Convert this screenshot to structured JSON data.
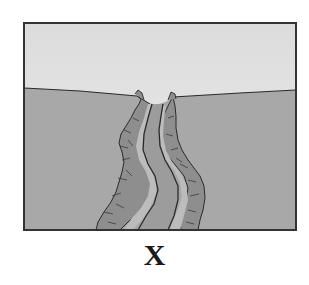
{
  "figure": {
    "label": "X",
    "colors": {
      "sky": "#e6e6e6",
      "ground": "#a9a9a9",
      "canyon_wall": "#8f8f8f",
      "canyon_rock_light": "#bdbdbd",
      "river": "#9a9a9a",
      "outline": "#2a2a2a",
      "border": "#333333"
    }
  }
}
